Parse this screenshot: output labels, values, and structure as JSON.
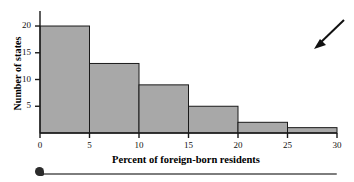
{
  "chart_data": {
    "type": "bar",
    "title": "",
    "subtitle": "",
    "xlabel": "Percent of foreign-born residents",
    "ylabel": "Number of states",
    "bin_width": 5,
    "bin_edges": [
      0,
      5,
      10,
      15,
      20,
      25,
      30
    ],
    "categories": [
      "0-5",
      "5-10",
      "10-15",
      "15-20",
      "20-25",
      "25-30"
    ],
    "values": [
      20,
      13,
      9,
      5,
      2,
      1
    ],
    "bars": [
      {
        "label": "0-5",
        "start": 0,
        "end": 5,
        "value": 20
      },
      {
        "label": "5-10",
        "start": 5,
        "end": 10,
        "value": 13
      },
      {
        "label": "10-15",
        "start": 10,
        "end": 15,
        "value": 9
      },
      {
        "label": "15-20",
        "start": 15,
        "end": 20,
        "value": 5
      },
      {
        "label": "20-25",
        "start": 20,
        "end": 25,
        "value": 2
      },
      {
        "label": "25-30",
        "start": 25,
        "end": 30,
        "value": 1
      }
    ],
    "xlim": [
      0,
      30
    ],
    "ylim": [
      0,
      21.5
    ],
    "xticks": [
      0,
      5,
      10,
      15,
      20,
      25,
      30
    ],
    "xtick_labels": [
      "0",
      "5",
      "10",
      "15",
      "20",
      "25",
      "30"
    ],
    "yticks": [
      5,
      10,
      15,
      20
    ],
    "ytick_labels": [
      "5",
      "10",
      "15",
      "20"
    ],
    "grid": false,
    "legend": null,
    "colors": {
      "bar_fill": "#a8a8a8",
      "bar_edge": "#1a1a1a",
      "axis": "#1a1a1a",
      "text": "#000000",
      "annotation_arrow": "#111111",
      "scan_rule": "#7d7d7d",
      "scan_blob": "#2b2b2b"
    },
    "annotations": [
      {
        "name": "pointer-arrow",
        "shape": "arrow",
        "direction": "down-left",
        "x": 30.5,
        "y": 19.5
      }
    ]
  }
}
